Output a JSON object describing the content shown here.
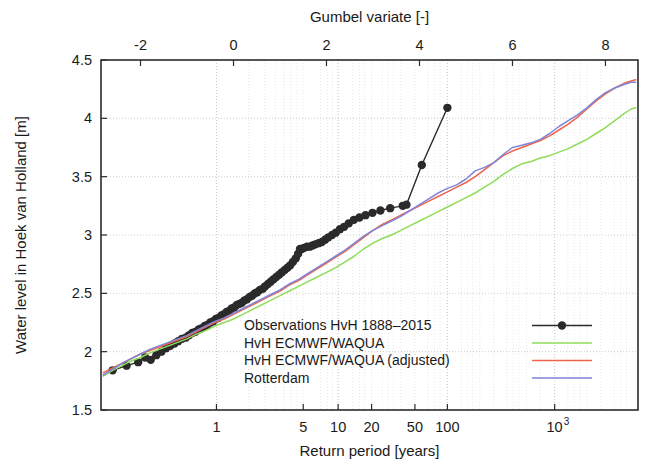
{
  "chart_data": {
    "type": "line",
    "title": "",
    "xlabel": "Return period [years]",
    "ylabel": "Water level in Hoek van Holland [m]",
    "x2label": "Gumbel variate [-]",
    "xscale": "gumbel",
    "xlim_gumbel": [
      -2.85,
      8.7
    ],
    "ylim": [
      1.5,
      4.5
    ],
    "grid": true,
    "legend_position": "lower right inside",
    "x_ticks": [
      {
        "label": "1",
        "gumbel": -0.3665,
        "return_period": 1
      },
      {
        "label": "5",
        "gumbel": 1.4999,
        "return_period": 5
      },
      {
        "label": "10",
        "gumbel": 2.2504,
        "return_period": 10
      },
      {
        "label": "20",
        "gumbel": 2.9702,
        "return_period": 20
      },
      {
        "label": "50",
        "gumbel": 3.9019,
        "return_period": 50
      },
      {
        "label": "100",
        "gumbel": 4.6001,
        "return_period": 100
      },
      {
        "label": "10",
        "exponent": "3",
        "gumbel": 6.9073,
        "return_period": 1000
      },
      {
        "label": "10",
        "exponent": "4",
        "gumbel": 9.2102,
        "return_period": 10000
      }
    ],
    "x2_ticks": [
      "-2",
      "0",
      "2",
      "4",
      "6",
      "8"
    ],
    "x2_tick_values": [
      -2,
      0,
      2,
      4,
      6,
      8
    ],
    "y_ticks": [
      "1.5",
      "2",
      "2.5",
      "3",
      "3.5",
      "4",
      "4.5"
    ],
    "y_tick_values": [
      1.5,
      2,
      2.5,
      3,
      3.5,
      4,
      4.5
    ],
    "series": [
      {
        "name": "Observations HvH 1888-2015",
        "legend_label": "Observations HvH 1888–2015",
        "color": "#2a2a2a",
        "marker": "circle",
        "marker_size": 4.2,
        "width": 1.4,
        "points": [
          [
            -2.6,
            1.84
          ],
          [
            -2.3,
            1.88
          ],
          [
            -2.05,
            1.91
          ],
          [
            -1.9,
            1.95
          ],
          [
            -1.78,
            1.93
          ],
          [
            -1.66,
            1.97
          ],
          [
            -1.55,
            2.0
          ],
          [
            -1.45,
            2.03
          ],
          [
            -1.36,
            2.05
          ],
          [
            -1.27,
            2.07
          ],
          [
            -1.19,
            2.09
          ],
          [
            -1.11,
            2.11
          ],
          [
            -1.03,
            2.12
          ],
          [
            -0.96,
            2.14
          ],
          [
            -0.89,
            2.16
          ],
          [
            -0.82,
            2.17
          ],
          [
            -0.75,
            2.19
          ],
          [
            -0.69,
            2.2
          ],
          [
            -0.62,
            2.22
          ],
          [
            -0.56,
            2.23
          ],
          [
            -0.5,
            2.25
          ],
          [
            -0.44,
            2.26
          ],
          [
            -0.38,
            2.28
          ],
          [
            -0.32,
            2.29
          ],
          [
            -0.26,
            2.31
          ],
          [
            -0.21,
            2.32
          ],
          [
            -0.15,
            2.34
          ],
          [
            -0.09,
            2.35
          ],
          [
            -0.04,
            2.37
          ],
          [
            0.02,
            2.38
          ],
          [
            0.07,
            2.4
          ],
          [
            0.13,
            2.41
          ],
          [
            0.18,
            2.42
          ],
          [
            0.24,
            2.44
          ],
          [
            0.29,
            2.45
          ],
          [
            0.35,
            2.47
          ],
          [
            0.4,
            2.48
          ],
          [
            0.46,
            2.5
          ],
          [
            0.51,
            2.51
          ],
          [
            0.57,
            2.53
          ],
          [
            0.63,
            2.54
          ],
          [
            0.68,
            2.56
          ],
          [
            0.74,
            2.58
          ],
          [
            0.8,
            2.6
          ],
          [
            0.86,
            2.62
          ],
          [
            0.92,
            2.64
          ],
          [
            0.98,
            2.66
          ],
          [
            1.04,
            2.68
          ],
          [
            1.1,
            2.7
          ],
          [
            1.16,
            2.72
          ],
          [
            1.22,
            2.74
          ],
          [
            1.28,
            2.77
          ],
          [
            1.34,
            2.8
          ],
          [
            1.39,
            2.84
          ],
          [
            1.43,
            2.88
          ],
          [
            1.47,
            2.88
          ],
          [
            1.52,
            2.89
          ],
          [
            1.58,
            2.9
          ],
          [
            1.64,
            2.9
          ],
          [
            1.7,
            2.91
          ],
          [
            1.76,
            2.92
          ],
          [
            1.83,
            2.93
          ],
          [
            1.9,
            2.94
          ],
          [
            1.97,
            2.96
          ],
          [
            2.04,
            2.98
          ],
          [
            2.12,
            3.0
          ],
          [
            2.2,
            3.02
          ],
          [
            2.29,
            3.05
          ],
          [
            2.38,
            3.07
          ],
          [
            2.48,
            3.1
          ],
          [
            2.59,
            3.13
          ],
          [
            2.71,
            3.15
          ],
          [
            2.84,
            3.17
          ],
          [
            2.99,
            3.19
          ],
          [
            3.16,
            3.21
          ],
          [
            3.37,
            3.23
          ],
          [
            3.64,
            3.25
          ],
          [
            3.72,
            3.26
          ],
          [
            4.05,
            3.6
          ],
          [
            4.6,
            4.09
          ]
        ]
      },
      {
        "name": "HvH ECMWF/WAQUA",
        "legend_label": "HvH ECMWF/WAQUA",
        "color": "#8fdc5a",
        "marker": "none",
        "width": 1.5,
        "points": [
          [
            -2.8,
            1.79
          ],
          [
            -2.6,
            1.84
          ],
          [
            -2.4,
            1.88
          ],
          [
            -2.2,
            1.92
          ],
          [
            -2.0,
            1.95
          ],
          [
            -1.8,
            1.99
          ],
          [
            -1.6,
            2.02
          ],
          [
            -1.4,
            2.05
          ],
          [
            -1.2,
            2.08
          ],
          [
            -1.0,
            2.11
          ],
          [
            -0.8,
            2.15
          ],
          [
            -0.6,
            2.18
          ],
          [
            -0.4,
            2.22
          ],
          [
            -0.2,
            2.25
          ],
          [
            0.0,
            2.28
          ],
          [
            0.2,
            2.32
          ],
          [
            0.4,
            2.36
          ],
          [
            0.6,
            2.4
          ],
          [
            0.8,
            2.44
          ],
          [
            1.0,
            2.48
          ],
          [
            1.2,
            2.52
          ],
          [
            1.4,
            2.56
          ],
          [
            1.6,
            2.6
          ],
          [
            1.8,
            2.64
          ],
          [
            2.0,
            2.68
          ],
          [
            2.2,
            2.72
          ],
          [
            2.4,
            2.77
          ],
          [
            2.6,
            2.82
          ],
          [
            2.8,
            2.88
          ],
          [
            3.0,
            2.93
          ],
          [
            3.2,
            2.97
          ],
          [
            3.4,
            3.0
          ],
          [
            3.6,
            3.04
          ],
          [
            3.8,
            3.08
          ],
          [
            4.0,
            3.12
          ],
          [
            4.2,
            3.16
          ],
          [
            4.4,
            3.2
          ],
          [
            4.6,
            3.24
          ],
          [
            4.8,
            3.28
          ],
          [
            5.0,
            3.32
          ],
          [
            5.2,
            3.36
          ],
          [
            5.4,
            3.41
          ],
          [
            5.6,
            3.46
          ],
          [
            5.8,
            3.52
          ],
          [
            6.0,
            3.57
          ],
          [
            6.2,
            3.61
          ],
          [
            6.4,
            3.63
          ],
          [
            6.6,
            3.66
          ],
          [
            6.8,
            3.68
          ],
          [
            7.0,
            3.71
          ],
          [
            7.2,
            3.74
          ],
          [
            7.4,
            3.78
          ],
          [
            7.6,
            3.82
          ],
          [
            7.8,
            3.87
          ],
          [
            8.0,
            3.92
          ],
          [
            8.2,
            3.98
          ],
          [
            8.4,
            4.04
          ],
          [
            8.55,
            4.08
          ],
          [
            8.65,
            4.09
          ]
        ]
      },
      {
        "name": "HvH ECMWF/WAQUA (adjusted)",
        "legend_label": "HvH ECMWF/WAQUA (adjusted)",
        "color": "#f0634a",
        "marker": "none",
        "width": 1.5,
        "points": [
          [
            -2.8,
            1.82
          ],
          [
            -2.6,
            1.86
          ],
          [
            -2.4,
            1.9
          ],
          [
            -2.2,
            1.94
          ],
          [
            -2.0,
            1.98
          ],
          [
            -1.8,
            2.01
          ],
          [
            -1.6,
            2.04
          ],
          [
            -1.4,
            2.07
          ],
          [
            -1.2,
            2.1
          ],
          [
            -1.0,
            2.13
          ],
          [
            -0.8,
            2.17
          ],
          [
            -0.6,
            2.21
          ],
          [
            -0.4,
            2.25
          ],
          [
            -0.2,
            2.28
          ],
          [
            0.0,
            2.32
          ],
          [
            0.2,
            2.36
          ],
          [
            0.4,
            2.4
          ],
          [
            0.6,
            2.44
          ],
          [
            0.8,
            2.48
          ],
          [
            1.0,
            2.52
          ],
          [
            1.2,
            2.57
          ],
          [
            1.4,
            2.61
          ],
          [
            1.6,
            2.66
          ],
          [
            1.8,
            2.71
          ],
          [
            2.0,
            2.76
          ],
          [
            2.2,
            2.81
          ],
          [
            2.4,
            2.86
          ],
          [
            2.6,
            2.92
          ],
          [
            2.8,
            2.98
          ],
          [
            3.0,
            3.04
          ],
          [
            3.2,
            3.09
          ],
          [
            3.4,
            3.13
          ],
          [
            3.6,
            3.17
          ],
          [
            3.8,
            3.21
          ],
          [
            4.0,
            3.25
          ],
          [
            4.2,
            3.29
          ],
          [
            4.4,
            3.33
          ],
          [
            4.6,
            3.37
          ],
          [
            4.8,
            3.41
          ],
          [
            5.0,
            3.45
          ],
          [
            5.2,
            3.5
          ],
          [
            5.4,
            3.56
          ],
          [
            5.6,
            3.62
          ],
          [
            5.8,
            3.68
          ],
          [
            6.0,
            3.72
          ],
          [
            6.2,
            3.75
          ],
          [
            6.4,
            3.78
          ],
          [
            6.6,
            3.81
          ],
          [
            6.8,
            3.85
          ],
          [
            7.0,
            3.9
          ],
          [
            7.2,
            3.95
          ],
          [
            7.4,
            4.01
          ],
          [
            7.6,
            4.08
          ],
          [
            7.8,
            4.15
          ],
          [
            8.0,
            4.21
          ],
          [
            8.2,
            4.26
          ],
          [
            8.4,
            4.3
          ],
          [
            8.55,
            4.32
          ],
          [
            8.65,
            4.33
          ]
        ]
      },
      {
        "name": "Rotterdam",
        "legend_label": "Rotterdam",
        "color": "#7f85d8",
        "marker": "none",
        "width": 1.5,
        "points": [
          [
            -2.8,
            1.8
          ],
          [
            -2.6,
            1.85
          ],
          [
            -2.4,
            1.9
          ],
          [
            -2.2,
            1.94
          ],
          [
            -2.0,
            1.98
          ],
          [
            -1.8,
            2.02
          ],
          [
            -1.6,
            2.05
          ],
          [
            -1.4,
            2.08
          ],
          [
            -1.2,
            2.11
          ],
          [
            -1.0,
            2.14
          ],
          [
            -0.8,
            2.18
          ],
          [
            -0.6,
            2.22
          ],
          [
            -0.4,
            2.26
          ],
          [
            -0.2,
            2.29
          ],
          [
            0.0,
            2.33
          ],
          [
            0.2,
            2.37
          ],
          [
            0.4,
            2.41
          ],
          [
            0.6,
            2.45
          ],
          [
            0.8,
            2.49
          ],
          [
            1.0,
            2.53
          ],
          [
            1.2,
            2.58
          ],
          [
            1.4,
            2.62
          ],
          [
            1.6,
            2.67
          ],
          [
            1.8,
            2.72
          ],
          [
            2.0,
            2.77
          ],
          [
            2.2,
            2.82
          ],
          [
            2.4,
            2.87
          ],
          [
            2.6,
            2.93
          ],
          [
            2.8,
            2.99
          ],
          [
            3.0,
            3.04
          ],
          [
            3.2,
            3.08
          ],
          [
            3.4,
            3.12
          ],
          [
            3.6,
            3.16
          ],
          [
            3.8,
            3.21
          ],
          [
            4.0,
            3.26
          ],
          [
            4.2,
            3.31
          ],
          [
            4.4,
            3.36
          ],
          [
            4.6,
            3.4
          ],
          [
            4.8,
            3.43
          ],
          [
            5.0,
            3.48
          ],
          [
            5.2,
            3.55
          ],
          [
            5.4,
            3.58
          ],
          [
            5.6,
            3.62
          ],
          [
            5.8,
            3.69
          ],
          [
            6.0,
            3.75
          ],
          [
            6.2,
            3.77
          ],
          [
            6.4,
            3.79
          ],
          [
            6.6,
            3.82
          ],
          [
            6.8,
            3.87
          ],
          [
            7.0,
            3.93
          ],
          [
            7.2,
            3.98
          ],
          [
            7.4,
            4.03
          ],
          [
            7.6,
            4.09
          ],
          [
            7.8,
            4.16
          ],
          [
            8.0,
            4.22
          ],
          [
            8.2,
            4.26
          ],
          [
            8.4,
            4.29
          ],
          [
            8.55,
            4.31
          ],
          [
            8.65,
            4.31
          ]
        ]
      }
    ],
    "minor_gridlines_gumbel": [
      -0.3665,
      0.3266,
      0.6717,
      0.9027,
      1.0836,
      1.2349,
      1.3665,
      1.4999,
      1.8698,
      2.0134,
      2.129,
      2.2504,
      2.5702,
      2.71,
      2.82,
      2.9702,
      3.2,
      3.33,
      3.44,
      3.6,
      3.9019,
      4.18,
      4.32,
      4.44,
      4.6001,
      4.9,
      5.03,
      5.14,
      5.3,
      5.6,
      5.88,
      6.02,
      6.14,
      6.3,
      6.6,
      6.9073,
      7.19,
      7.33,
      7.45,
      7.6,
      7.9,
      8.19,
      8.33,
      8.45
    ],
    "major_gridlines_gumbel": [
      -0.3665,
      2.2504,
      4.6001,
      6.9073,
      9.2102
    ]
  }
}
